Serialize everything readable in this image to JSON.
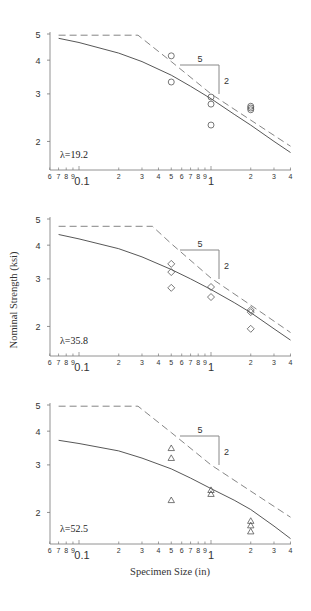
{
  "chart_data": [
    {
      "type": "scatter",
      "panel": "top",
      "annotation": "λ=19.2",
      "marker": "circle",
      "xscale": "log",
      "yscale": "log",
      "xlim": [
        0.06,
        4
      ],
      "ylim": [
        1.6,
        5.1
      ],
      "xlabel": "",
      "ylabel": "",
      "x_tick_labels": [
        "6",
        "7",
        "8",
        "9",
        "0.1",
        "2",
        "3",
        "4",
        "5",
        "6",
        "7",
        "8",
        "9",
        "1",
        "2",
        "3",
        "4"
      ],
      "y_tick_labels": [
        "2",
        "3",
        "4",
        "5"
      ],
      "points": [
        {
          "x": 0.5,
          "y": 4.15
        },
        {
          "x": 0.5,
          "y": 3.32
        },
        {
          "x": 1.0,
          "y": 2.92
        },
        {
          "x": 1.0,
          "y": 2.75
        },
        {
          "x": 1.0,
          "y": 2.3
        },
        {
          "x": 2.0,
          "y": 2.7
        },
        {
          "x": 2.0,
          "y": 2.66
        },
        {
          "x": 2.0,
          "y": 2.62
        }
      ],
      "series": [
        {
          "name": "solid-curve",
          "style": "solid",
          "x": [
            0.07,
            0.1,
            0.2,
            0.3,
            0.5,
            0.7,
            1.0,
            1.5,
            2.0,
            3.0,
            4.0
          ],
          "y": [
            4.82,
            4.65,
            4.25,
            3.95,
            3.52,
            3.2,
            2.88,
            2.52,
            2.3,
            2.0,
            1.82
          ]
        },
        {
          "name": "dashed-curve",
          "style": "dashed",
          "x": [
            0.07,
            0.28,
            0.5,
            1.0,
            2.0,
            4.0
          ],
          "y": [
            4.95,
            4.95,
            3.95,
            3.0,
            2.4,
            1.92
          ]
        }
      ],
      "slope_triangle": {
        "run_label": "5",
        "rise_label": "2"
      }
    },
    {
      "type": "scatter",
      "panel": "middle",
      "annotation": "λ=35.8",
      "marker": "diamond",
      "xscale": "log",
      "yscale": "log",
      "xlim": [
        0.06,
        4
      ],
      "ylim": [
        1.6,
        5.1
      ],
      "xlabel": "",
      "ylabel": "Nominal Strength (ksi)",
      "x_tick_labels": [
        "6",
        "7",
        "8",
        "9",
        "0.1",
        "2",
        "3",
        "4",
        "5",
        "6",
        "7",
        "8",
        "9",
        "1",
        "2",
        "3",
        "4"
      ],
      "y_tick_labels": [
        "2",
        "3",
        "4",
        "5"
      ],
      "points": [
        {
          "x": 0.5,
          "y": 3.41
        },
        {
          "x": 0.5,
          "y": 3.18
        },
        {
          "x": 0.5,
          "y": 2.78
        },
        {
          "x": 1.0,
          "y": 2.8
        },
        {
          "x": 1.0,
          "y": 2.57
        },
        {
          "x": 2.0,
          "y": 2.3
        },
        {
          "x": 2.0,
          "y": 2.26
        },
        {
          "x": 2.0,
          "y": 1.96
        }
      ],
      "series": [
        {
          "name": "solid-curve",
          "style": "solid",
          "x": [
            0.07,
            0.1,
            0.2,
            0.3,
            0.5,
            0.7,
            1.0,
            1.5,
            2.0,
            3.0,
            4.0
          ],
          "y": [
            4.38,
            4.22,
            3.88,
            3.62,
            3.25,
            3.0,
            2.74,
            2.45,
            2.25,
            1.96,
            1.78
          ]
        },
        {
          "name": "dashed-curve",
          "style": "dashed",
          "x": [
            0.07,
            0.36,
            0.5,
            1.0,
            2.0,
            4.0
          ],
          "y": [
            4.7,
            4.7,
            4.05,
            3.02,
            2.4,
            1.9
          ]
        }
      ],
      "slope_triangle": {
        "run_label": "5",
        "rise_label": "2"
      }
    },
    {
      "type": "scatter",
      "panel": "bottom",
      "annotation": "λ=52.5",
      "marker": "triangle",
      "xscale": "log",
      "yscale": "log",
      "xlim": [
        0.06,
        4
      ],
      "ylim": [
        1.6,
        5.1
      ],
      "xlabel": "Specimen Size (in)",
      "ylabel": "",
      "x_tick_labels": [
        "6",
        "7",
        "8",
        "9",
        "0.1",
        "2",
        "3",
        "4",
        "5",
        "6",
        "7",
        "8",
        "9",
        "1",
        "2",
        "3",
        "4"
      ],
      "y_tick_labels": [
        "2",
        "3",
        "4",
        "5"
      ],
      "points": [
        {
          "x": 0.5,
          "y": 3.46
        },
        {
          "x": 0.5,
          "y": 3.18
        },
        {
          "x": 0.5,
          "y": 2.22
        },
        {
          "x": 1.0,
          "y": 2.42
        },
        {
          "x": 1.0,
          "y": 2.34
        },
        {
          "x": 2.0,
          "y": 1.86
        },
        {
          "x": 2.0,
          "y": 1.79
        },
        {
          "x": 2.0,
          "y": 1.7
        }
      ],
      "series": [
        {
          "name": "solid-curve",
          "style": "solid",
          "x": [
            0.07,
            0.1,
            0.2,
            0.3,
            0.5,
            0.7,
            1.0,
            1.5,
            2.0,
            3.0,
            4.0
          ],
          "y": [
            3.7,
            3.6,
            3.38,
            3.18,
            2.9,
            2.68,
            2.45,
            2.22,
            2.05,
            1.78,
            1.6
          ]
        },
        {
          "name": "dashed-curve",
          "style": "dashed",
          "x": [
            0.07,
            0.28,
            0.5,
            1.0,
            2.0,
            4.0
          ],
          "y": [
            4.95,
            4.95,
            3.95,
            3.0,
            2.4,
            1.92
          ]
        }
      ],
      "slope_triangle": {
        "run_label": "5",
        "rise_label": "2"
      }
    }
  ],
  "axis": {
    "ylabel": "Nominal Strength (ksi)",
    "xlabel": "Specimen Size (in)"
  }
}
